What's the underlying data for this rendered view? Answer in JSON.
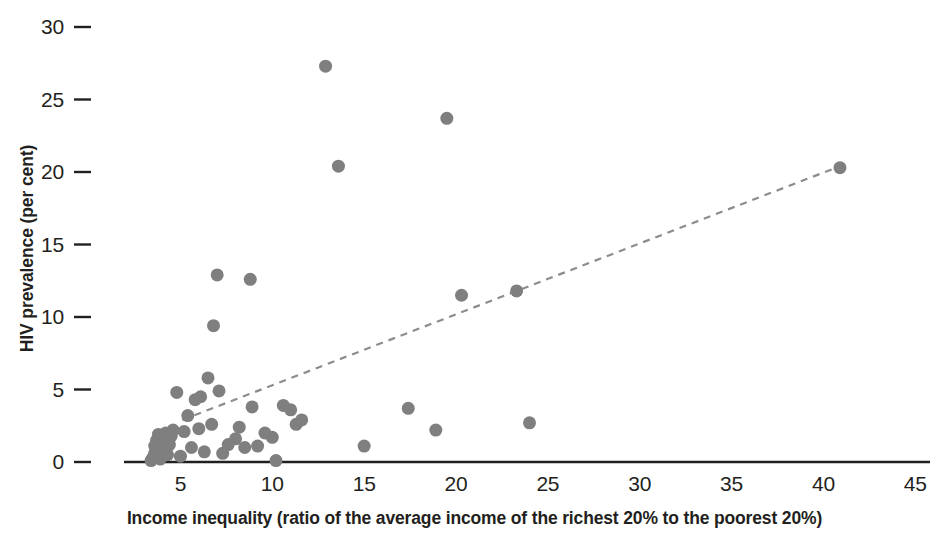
{
  "chart_data": {
    "type": "scatter",
    "title": "",
    "xlabel": "Income inequality (ratio of the average income of the richest 20% to the poorest 20%)",
    "ylabel": "HIV prevalence (per cent)",
    "xlim": [
      2.2,
      45.8
    ],
    "ylim": [
      -0.6,
      30.6
    ],
    "xticks": [
      5,
      10,
      15,
      20,
      25,
      30,
      35,
      40,
      45
    ],
    "yticks": [
      0,
      5,
      10,
      15,
      20,
      25,
      30
    ],
    "grid": false,
    "legend": null,
    "marker": {
      "shape": "circle",
      "color": "#7f7f7f",
      "size_px": 13
    },
    "axis_color": "#231f20",
    "points": [
      {
        "x": 3.4,
        "y": 0.1
      },
      {
        "x": 3.5,
        "y": 0.3
      },
      {
        "x": 3.6,
        "y": 0.6
      },
      {
        "x": 3.6,
        "y": 1.1
      },
      {
        "x": 3.7,
        "y": 1.5
      },
      {
        "x": 3.8,
        "y": 1.9
      },
      {
        "x": 3.9,
        "y": 0.2
      },
      {
        "x": 4.0,
        "y": 0.9
      },
      {
        "x": 4.1,
        "y": 1.4
      },
      {
        "x": 4.2,
        "y": 2.0
      },
      {
        "x": 4.3,
        "y": 0.5
      },
      {
        "x": 4.4,
        "y": 1.2
      },
      {
        "x": 4.5,
        "y": 1.8
      },
      {
        "x": 4.6,
        "y": 2.2
      },
      {
        "x": 4.8,
        "y": 4.8
      },
      {
        "x": 5.0,
        "y": 0.4
      },
      {
        "x": 5.2,
        "y": 2.1
      },
      {
        "x": 5.4,
        "y": 3.2
      },
      {
        "x": 5.6,
        "y": 1.0
      },
      {
        "x": 5.8,
        "y": 4.3
      },
      {
        "x": 6.0,
        "y": 2.3
      },
      {
        "x": 6.1,
        "y": 4.5
      },
      {
        "x": 6.3,
        "y": 0.7
      },
      {
        "x": 6.5,
        "y": 5.8
      },
      {
        "x": 6.7,
        "y": 2.6
      },
      {
        "x": 6.8,
        "y": 9.4
      },
      {
        "x": 7.0,
        "y": 12.9
      },
      {
        "x": 7.1,
        "y": 4.9
      },
      {
        "x": 7.3,
        "y": 0.6
      },
      {
        "x": 7.6,
        "y": 1.2
      },
      {
        "x": 8.0,
        "y": 1.6
      },
      {
        "x": 8.2,
        "y": 2.4
      },
      {
        "x": 8.5,
        "y": 1.0
      },
      {
        "x": 8.8,
        "y": 12.6
      },
      {
        "x": 8.9,
        "y": 3.8
      },
      {
        "x": 9.2,
        "y": 1.1
      },
      {
        "x": 9.6,
        "y": 2.0
      },
      {
        "x": 10.0,
        "y": 1.7
      },
      {
        "x": 10.2,
        "y": 0.1
      },
      {
        "x": 10.6,
        "y": 3.9
      },
      {
        "x": 11.0,
        "y": 3.6
      },
      {
        "x": 11.3,
        "y": 2.6
      },
      {
        "x": 11.6,
        "y": 2.9
      },
      {
        "x": 12.9,
        "y": 27.3
      },
      {
        "x": 13.6,
        "y": 20.4
      },
      {
        "x": 15.0,
        "y": 1.1
      },
      {
        "x": 17.4,
        "y": 3.7
      },
      {
        "x": 18.9,
        "y": 2.2
      },
      {
        "x": 19.5,
        "y": 23.7
      },
      {
        "x": 20.3,
        "y": 11.5
      },
      {
        "x": 23.3,
        "y": 11.8
      },
      {
        "x": 24.0,
        "y": 2.7
      },
      {
        "x": 40.9,
        "y": 20.3
      }
    ],
    "trendline": {
      "style": "dashed",
      "color": "#8c8c8c",
      "x_start": 5.1,
      "y_start": 2.9,
      "x_end": 40.9,
      "y_end": 20.4
    }
  }
}
